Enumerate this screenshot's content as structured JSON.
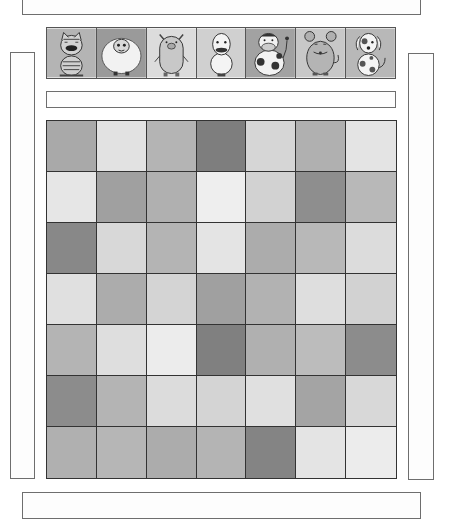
{
  "top_box": {
    "text": ""
  },
  "bottom_box": {
    "text": ""
  },
  "banner": {
    "text": ""
  },
  "left_panel": {
    "text": ""
  },
  "right_panel": {
    "text": ""
  },
  "animals": [
    {
      "name": "cat",
      "bg": "#b4b4b4"
    },
    {
      "name": "sheep",
      "bg": "#9a9a9a"
    },
    {
      "name": "pig",
      "bg": "#dcdcdc"
    },
    {
      "name": "duck",
      "bg": "#d0d0d0"
    },
    {
      "name": "cow",
      "bg": "#a2a2a2"
    },
    {
      "name": "mouse",
      "bg": "#c8c8c8"
    },
    {
      "name": "dog",
      "bg": "#b8b8b8"
    }
  ],
  "grid": {
    "rows": 7,
    "cols": 7,
    "cells": [
      [
        "#a9a9a9",
        "#e2e2e2",
        "#b4b4b4",
        "#7e7e7e",
        "#d6d6d6",
        "#b0b0b0",
        "#e4e4e4"
      ],
      [
        "#e6e6e6",
        "#a0a0a0",
        "#b0b0b0",
        "#eeeeee",
        "#d2d2d2",
        "#8e8e8e",
        "#b8b8b8"
      ],
      [
        "#888888",
        "#d8d8d8",
        "#b4b4b4",
        "#e4e4e4",
        "#acacac",
        "#b8b8b8",
        "#dcdcdc"
      ],
      [
        "#e0e0e0",
        "#acacac",
        "#d4d4d4",
        "#a0a0a0",
        "#b2b2b2",
        "#dedede",
        "#d2d2d2"
      ],
      [
        "#b4b4b4",
        "#dedede",
        "#ececec",
        "#808080",
        "#b0b0b0",
        "#bcbcbc",
        "#8c8c8c"
      ],
      [
        "#8c8c8c",
        "#b4b4b4",
        "#dcdcdc",
        "#d4d4d4",
        "#e0e0e0",
        "#a4a4a4",
        "#d8d8d8"
      ],
      [
        "#b0b0b0",
        "#b6b6b6",
        "#acacac",
        "#b4b4b4",
        "#848484",
        "#e4e4e4",
        "#ececec"
      ]
    ]
  }
}
